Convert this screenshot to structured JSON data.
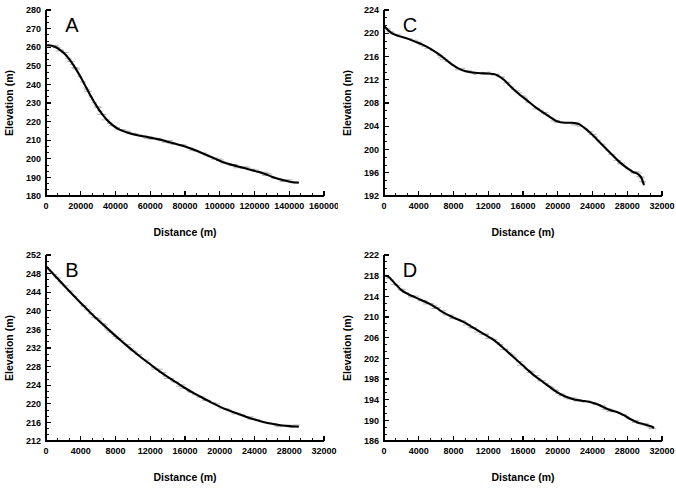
{
  "figure": {
    "background": "#ffffff",
    "curve_color": "#000000",
    "scatter_color": "#9a9a9a",
    "panel_count": 4
  },
  "chart_data": [
    {
      "type": "line",
      "panel_label": "A",
      "title": "",
      "xlabel": "Distance (m)",
      "ylabel": "Elevation (m)",
      "xlim": [
        0,
        160000
      ],
      "ylim": [
        180,
        280
      ],
      "xticks": [
        0,
        20000,
        40000,
        60000,
        80000,
        100000,
        120000,
        140000,
        160000
      ],
      "yticks": [
        180,
        190,
        200,
        210,
        220,
        230,
        240,
        250,
        260,
        270,
        280
      ],
      "xtick_labels": [
        "0",
        "20000",
        "40000",
        "60000",
        "80000",
        "100000",
        "120000",
        "140000",
        "160000"
      ],
      "ytick_labels": [
        "180",
        "190",
        "200",
        "210",
        "220",
        "230",
        "240",
        "250",
        "260",
        "270",
        "280"
      ],
      "x_minor_count": 2,
      "y_minor_count": 2,
      "grid": false,
      "legend": false,
      "x": [
        0,
        2000,
        5000,
        8000,
        11000,
        14000,
        17000,
        20000,
        23000,
        26000,
        29000,
        32000,
        35000,
        38000,
        41000,
        44000,
        47000,
        50000,
        54000,
        58000,
        62000,
        66000,
        70000,
        74000,
        78000,
        82000,
        86000,
        90000,
        94000,
        98000,
        102000,
        106000,
        110000,
        114000,
        118000,
        122000,
        126000,
        130000,
        134000,
        138000,
        142000,
        145000
      ],
      "y": [
        261.0,
        261.0,
        260.2,
        258.6,
        256.2,
        252.8,
        248.6,
        243.8,
        238.6,
        233.4,
        228.6,
        224.4,
        221.0,
        218.4,
        216.4,
        215.0,
        214.0,
        213.2,
        212.4,
        211.8,
        211.0,
        210.2,
        209.2,
        208.2,
        207.2,
        206.0,
        204.6,
        203.0,
        201.4,
        199.8,
        198.2,
        197.0,
        196.0,
        195.0,
        194.0,
        193.0,
        191.8,
        190.4,
        189.2,
        188.2,
        187.4,
        187.2
      ]
    },
    {
      "type": "line",
      "panel_label": "B",
      "title": "",
      "xlabel": "Distance (m)",
      "ylabel": "Elevation (m)",
      "xlim": [
        0,
        32000
      ],
      "ylim": [
        212,
        252
      ],
      "xticks": [
        0,
        4000,
        8000,
        12000,
        16000,
        20000,
        24000,
        28000,
        32000
      ],
      "yticks": [
        212,
        216,
        220,
        224,
        228,
        232,
        236,
        240,
        244,
        248,
        252
      ],
      "xtick_labels": [
        "0",
        "4000",
        "8000",
        "12000",
        "16000",
        "20000",
        "24000",
        "28000",
        "32000"
      ],
      "ytick_labels": [
        "212",
        "216",
        "220",
        "224",
        "228",
        "232",
        "236",
        "240",
        "244",
        "248",
        "252"
      ],
      "x_minor_count": 2,
      "y_minor_count": 2,
      "grid": false,
      "legend": false,
      "x": [
        0,
        1000,
        2000,
        3000,
        4000,
        5000,
        6000,
        7000,
        8000,
        9000,
        10000,
        11000,
        12000,
        13000,
        14000,
        15000,
        16000,
        17000,
        18000,
        19000,
        20000,
        21000,
        22000,
        23000,
        24000,
        25000,
        26000,
        27000,
        28000,
        29000
      ],
      "y": [
        249.6,
        247.6,
        245.6,
        243.6,
        241.7,
        239.8,
        238.0,
        236.3,
        234.6,
        233.0,
        231.4,
        229.9,
        228.5,
        227.1,
        225.8,
        224.6,
        223.4,
        222.3,
        221.3,
        220.3,
        219.4,
        218.6,
        217.9,
        217.2,
        216.6,
        216.1,
        215.7,
        215.4,
        215.2,
        215.1
      ]
    },
    {
      "type": "line",
      "panel_label": "C",
      "title": "",
      "xlabel": "Distance (m)",
      "ylabel": "Elevation (m)",
      "xlim": [
        0,
        32000
      ],
      "ylim": [
        192,
        224
      ],
      "xticks": [
        0,
        4000,
        8000,
        12000,
        16000,
        20000,
        24000,
        28000,
        32000
      ],
      "yticks": [
        192,
        196,
        200,
        204,
        208,
        212,
        216,
        220,
        224
      ],
      "xtick_labels": [
        "0",
        "4000",
        "8000",
        "12000",
        "16000",
        "20000",
        "24000",
        "28000",
        "32000"
      ],
      "ytick_labels": [
        "192",
        "196",
        "200",
        "204",
        "208",
        "212",
        "216",
        "220",
        "224"
      ],
      "x_minor_count": 2,
      "y_minor_count": 2,
      "grid": false,
      "legend": false,
      "x": [
        0,
        300,
        800,
        1500,
        2500,
        3500,
        4500,
        5500,
        6500,
        7500,
        8500,
        9500,
        10500,
        11500,
        12500,
        13000,
        13800,
        14600,
        15500,
        16500,
        17500,
        18500,
        19300,
        20000,
        20800,
        21600,
        22400,
        23000,
        23800,
        24600,
        25400,
        26200,
        27000,
        27800,
        28600,
        29200,
        29600,
        29900
      ],
      "y": [
        221.3,
        220.8,
        220.1,
        219.6,
        219.2,
        218.6,
        218.0,
        217.2,
        216.2,
        215.0,
        214.0,
        213.4,
        213.2,
        213.1,
        213.0,
        212.8,
        212.0,
        210.8,
        209.6,
        208.4,
        207.2,
        206.2,
        205.4,
        204.8,
        204.6,
        204.6,
        204.4,
        203.8,
        202.8,
        201.6,
        200.4,
        199.2,
        198.0,
        197.0,
        196.2,
        195.8,
        195.2,
        194.0
      ]
    },
    {
      "type": "line",
      "panel_label": "D",
      "title": "",
      "xlabel": "Distance (m)",
      "ylabel": "Elevation (m)",
      "xlim": [
        0,
        32000
      ],
      "ylim": [
        186,
        222
      ],
      "xticks": [
        0,
        4000,
        8000,
        12000,
        16000,
        20000,
        24000,
        28000,
        32000
      ],
      "yticks": [
        186,
        190,
        194,
        198,
        202,
        206,
        210,
        214,
        218,
        222
      ],
      "xtick_labels": [
        "0",
        "4000",
        "8000",
        "12000",
        "16000",
        "20000",
        "24000",
        "28000",
        "32000"
      ],
      "ytick_labels": [
        "186",
        "190",
        "194",
        "198",
        "202",
        "206",
        "210",
        "214",
        "218",
        "222"
      ],
      "x_minor_count": 2,
      "y_minor_count": 2,
      "grid": false,
      "legend": false,
      "x": [
        0,
        500,
        1200,
        2000,
        2800,
        3600,
        4400,
        5200,
        6000,
        6800,
        7600,
        8400,
        9200,
        10000,
        10800,
        11600,
        12400,
        13200,
        14000,
        14800,
        15600,
        16400,
        17200,
        18000,
        18800,
        19600,
        20400,
        21200,
        22000,
        22800,
        23600,
        24400,
        25200,
        26000,
        26800,
        27600,
        28400,
        29200,
        30000,
        30800,
        31000
      ],
      "y": [
        218.0,
        217.8,
        216.6,
        215.2,
        214.4,
        213.8,
        213.2,
        212.6,
        211.8,
        210.9,
        210.2,
        209.6,
        209.0,
        208.2,
        207.4,
        206.6,
        205.8,
        204.8,
        203.6,
        202.4,
        201.2,
        200.0,
        198.8,
        197.8,
        196.8,
        195.8,
        195.0,
        194.4,
        194.0,
        193.8,
        193.6,
        193.2,
        192.6,
        192.0,
        191.6,
        191.0,
        190.2,
        189.6,
        189.2,
        188.8,
        188.6
      ]
    }
  ]
}
